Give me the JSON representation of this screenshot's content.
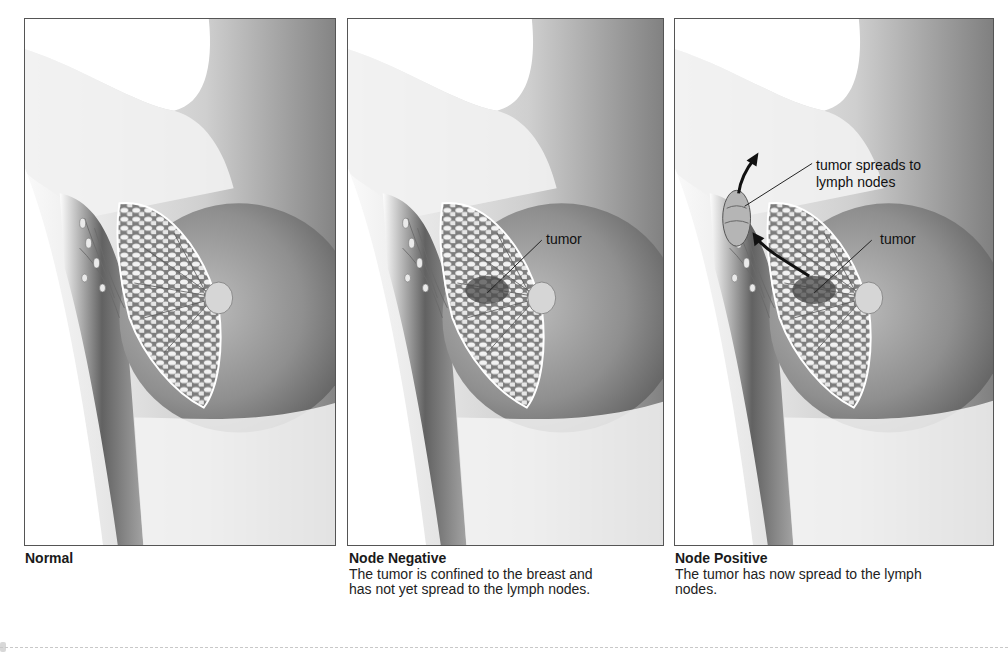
{
  "figure": {
    "panels": [
      {
        "id": "normal",
        "title": "Normal",
        "description": "",
        "annotations": []
      },
      {
        "id": "node-negative",
        "title": "Node Negative",
        "description": "The tumor is confined to the breast and has not yet spread to the lymph nodes.",
        "annotations": [
          {
            "label": "tumor"
          }
        ]
      },
      {
        "id": "node-positive",
        "title": "Node Positive",
        "description": "The tumor has now spread to the lymph nodes.",
        "annotations": [
          {
            "label_line1": "tumor spreads to",
            "label_line2": "lymph nodes"
          },
          {
            "label": "tumor"
          }
        ]
      }
    ],
    "colors": {
      "border": "#555555",
      "skin_light": "#f4f4f4",
      "skin_dark": "#6e6e6e",
      "tissue": "#e8e8e8",
      "arrow": "#1a1a1a"
    }
  }
}
